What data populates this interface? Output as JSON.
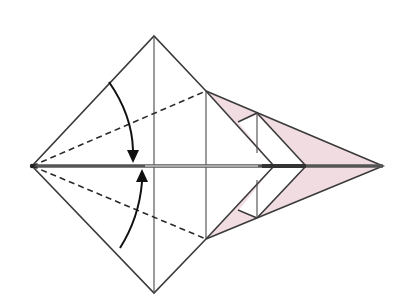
{
  "diagram": {
    "type": "origami-fold-step",
    "colors": {
      "paper_front": "#ffffff",
      "paper_back": "#f1dde1",
      "line": "#3a3a3a",
      "arrow": "#111111"
    },
    "points": {
      "left_tip": [
        32,
        166
      ],
      "top": [
        154,
        36
      ],
      "bottom": [
        154,
        293
      ],
      "upper_right": [
        206,
        91
      ],
      "lower_right": [
        206,
        239
      ],
      "right_tip": [
        383,
        166
      ]
    },
    "fold_lines": [
      {
        "type": "valley",
        "from": "left_tip",
        "to": "upper_right"
      },
      {
        "type": "valley",
        "from": "left_tip",
        "to": "lower_right"
      }
    ],
    "arrows": [
      {
        "name": "fold-arrow-upper",
        "direction": "down",
        "target": "center-line"
      },
      {
        "name": "fold-arrow-lower",
        "direction": "up",
        "target": "center-line"
      }
    ]
  }
}
